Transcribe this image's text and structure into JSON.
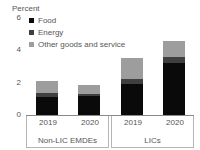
{
  "chart_data": {
    "type": "bar",
    "title": "",
    "subtitle": "",
    "xlabel": "",
    "ylabel": "Percent",
    "unit_label": "Percent",
    "ylim": [
      0,
      6
    ],
    "yticks": [
      0,
      2,
      4,
      6
    ],
    "ytick_labels": [
      "0",
      "2",
      "4",
      "6"
    ],
    "grid": false,
    "stacked": true,
    "legend_position": "top-left",
    "categories": [
      "2019",
      "2020",
      "2019",
      "2020"
    ],
    "groups": [
      {
        "name": "Non-LIC EMDEs",
        "categories": [
          "2019",
          "2020"
        ]
      },
      {
        "name": "LICs",
        "categories": [
          "2019",
          "2020"
        ]
      }
    ],
    "series": [
      {
        "name": "Food",
        "color": "#0a0a0a",
        "values": [
          1.1,
          1.2,
          1.9,
          3.2
        ]
      },
      {
        "name": "Energy",
        "color": "#3f3f3f",
        "values": [
          0.25,
          0.1,
          0.35,
          0.4
        ]
      },
      {
        "name": "Other goods and service",
        "color": "#9d9d9d",
        "values": [
          0.75,
          0.55,
          1.25,
          1.0
        ]
      }
    ],
    "totals": [
      2.1,
      1.85,
      3.5,
      4.6
    ]
  },
  "legend": {
    "items": [
      {
        "label": "Food",
        "color": "#0a0a0a"
      },
      {
        "label": "Energy",
        "color": "#3f3f3f"
      },
      {
        "label": "Other goods and service",
        "color": "#9d9d9d"
      }
    ]
  },
  "axis": {
    "unit_label": "Percent",
    "ytick_0": "0",
    "ytick_1": "2",
    "ytick_2": "4",
    "ytick_3": "6"
  },
  "xaxis": {
    "group_0_name": "Non-LIC EMDEs",
    "group_0_cat_0": "2019",
    "group_0_cat_1": "2020",
    "group_1_name": "LICs",
    "group_1_cat_0": "2019",
    "group_1_cat_1": "2020"
  }
}
